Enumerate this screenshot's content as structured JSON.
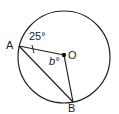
{
  "diagram": {
    "type": "circle-geometry",
    "points": {
      "A": {
        "label": "A"
      },
      "O": {
        "label": "O"
      },
      "B": {
        "label": "B"
      }
    },
    "angle_label_A": "25°",
    "angle_label_O": "b°"
  }
}
